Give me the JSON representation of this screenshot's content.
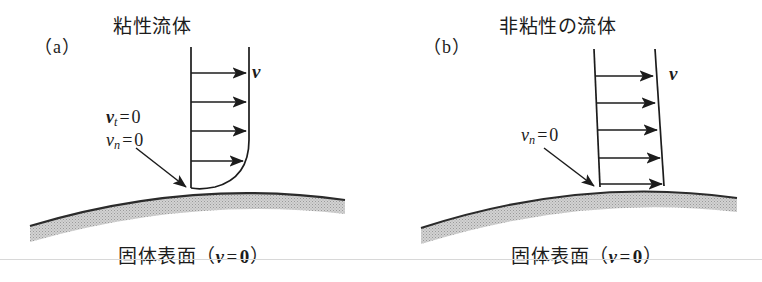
{
  "figure": {
    "background_color": "#ffffff",
    "ink_color": "#1c1c1c",
    "surface_fill_color": "#c9c9c9",
    "rule_color": "#d8d8d8"
  },
  "panels": [
    {
      "tag": "（a）",
      "heading": "粘性流体",
      "caption_text": "固体表面",
      "caption_paren_open": "（",
      "caption_symbol": "v",
      "caption_equals": "=",
      "caption_value": "0",
      "caption_paren_close": "）",
      "velocity_label": "v",
      "annotations": [
        {
          "symbol": "v",
          "subscript": "t",
          "equals": "=",
          "value": "0",
          "style": "vector"
        },
        {
          "symbol": "v",
          "subscript": "n",
          "equals": "=",
          "value": "0",
          "style": "scalar"
        }
      ],
      "profile_type": "no-slip-parabolic",
      "arrow_count": 4
    },
    {
      "tag": "（b）",
      "heading": "非粘性の流体",
      "caption_text": "固体表面",
      "caption_paren_open": "（",
      "caption_symbol": "v",
      "caption_equals": "=",
      "caption_value": "0",
      "caption_paren_close": "）",
      "velocity_label": "v",
      "annotations": [
        {
          "symbol": "v",
          "subscript": "n",
          "equals": "=",
          "value": "0",
          "style": "scalar"
        }
      ],
      "profile_type": "slip-uniform",
      "arrow_count": 5
    }
  ]
}
